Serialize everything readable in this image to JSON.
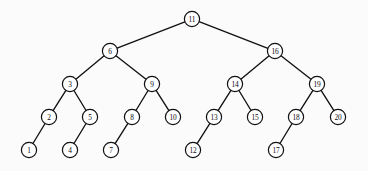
{
  "figure": {
    "background_color": "#fbfbfc",
    "node_fill_color": "#ffffff",
    "node_stroke_color": "#101014",
    "edge_color": "#111114",
    "label_color": "#0c0c10",
    "node_radius": 7.6
  },
  "chart_data": {
    "type": "diagram",
    "subtype": "binary-search-tree",
    "node_count": 20,
    "depth": 5,
    "root": "11",
    "nodes": [
      {
        "id": "n11",
        "label": "11",
        "x": 192,
        "y": 19,
        "level": 0
      },
      {
        "id": "n6",
        "label": "6",
        "x": 110,
        "y": 51,
        "level": 1
      },
      {
        "id": "n16",
        "label": "16",
        "x": 275,
        "y": 51,
        "level": 1
      },
      {
        "id": "n3",
        "label": "3",
        "x": 70,
        "y": 84,
        "level": 2
      },
      {
        "id": "n9",
        "label": "9",
        "x": 152,
        "y": 84,
        "level": 2
      },
      {
        "id": "n14",
        "label": "14",
        "x": 235,
        "y": 84,
        "level": 2
      },
      {
        "id": "n19",
        "label": "19",
        "x": 317,
        "y": 84,
        "level": 2
      },
      {
        "id": "n2",
        "label": "2",
        "x": 49,
        "y": 117,
        "level": 3
      },
      {
        "id": "n5",
        "label": "5",
        "x": 90,
        "y": 117,
        "level": 3
      },
      {
        "id": "n8",
        "label": "8",
        "x": 132,
        "y": 117,
        "level": 3
      },
      {
        "id": "n10",
        "label": "10",
        "x": 173,
        "y": 117,
        "level": 3
      },
      {
        "id": "n13",
        "label": "13",
        "x": 214,
        "y": 117,
        "level": 3
      },
      {
        "id": "n15",
        "label": "15",
        "x": 255,
        "y": 117,
        "level": 3
      },
      {
        "id": "n18",
        "label": "18",
        "x": 296,
        "y": 117,
        "level": 3
      },
      {
        "id": "n20",
        "label": "20",
        "x": 338,
        "y": 117,
        "level": 3
      },
      {
        "id": "n1",
        "label": "1",
        "x": 29,
        "y": 150,
        "level": 4
      },
      {
        "id": "n4",
        "label": "4",
        "x": 70,
        "y": 150,
        "level": 4
      },
      {
        "id": "n7",
        "label": "7",
        "x": 111,
        "y": 150,
        "level": 4
      },
      {
        "id": "n12",
        "label": "12",
        "x": 193,
        "y": 150,
        "level": 4
      },
      {
        "id": "n17",
        "label": "17",
        "x": 276,
        "y": 150,
        "level": 4
      }
    ],
    "edges": [
      {
        "from": "n11",
        "to": "n6",
        "side": "left"
      },
      {
        "from": "n11",
        "to": "n16",
        "side": "right"
      },
      {
        "from": "n6",
        "to": "n3",
        "side": "left"
      },
      {
        "from": "n6",
        "to": "n9",
        "side": "right"
      },
      {
        "from": "n16",
        "to": "n14",
        "side": "left"
      },
      {
        "from": "n16",
        "to": "n19",
        "side": "right"
      },
      {
        "from": "n3",
        "to": "n2",
        "side": "left"
      },
      {
        "from": "n3",
        "to": "n5",
        "side": "right"
      },
      {
        "from": "n9",
        "to": "n8",
        "side": "left"
      },
      {
        "from": "n9",
        "to": "n10",
        "side": "right"
      },
      {
        "from": "n14",
        "to": "n13",
        "side": "left"
      },
      {
        "from": "n14",
        "to": "n15",
        "side": "right"
      },
      {
        "from": "n19",
        "to": "n18",
        "side": "left"
      },
      {
        "from": "n19",
        "to": "n20",
        "side": "right"
      },
      {
        "from": "n2",
        "to": "n1",
        "side": "left"
      },
      {
        "from": "n5",
        "to": "n4",
        "side": "left"
      },
      {
        "from": "n8",
        "to": "n7",
        "side": "left"
      },
      {
        "from": "n13",
        "to": "n12",
        "side": "left"
      },
      {
        "from": "n18",
        "to": "n17",
        "side": "left"
      }
    ]
  }
}
